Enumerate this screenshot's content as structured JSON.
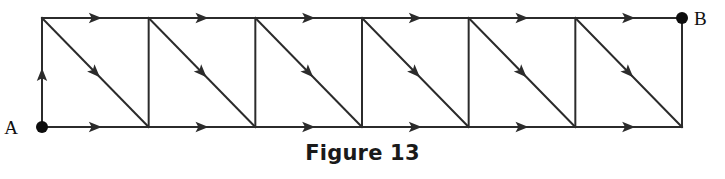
{
  "figure": {
    "caption": "Figure 13",
    "nodes": [
      {
        "id": "A",
        "label": "A",
        "x": 42,
        "y": 127,
        "label_x": 18,
        "label_y": 134
      },
      {
        "id": "B",
        "label": "B",
        "x": 682,
        "y": 18,
        "label_x": 694,
        "label_y": 25
      }
    ],
    "geometry": {
      "left": 42,
      "right": 682,
      "top": 18,
      "bottom": 127,
      "cells": 6,
      "cell_width": 106.67,
      "stroke_color": "#2b2b2b",
      "stroke_width": 2,
      "node_radius": 6,
      "node_color": "#0d0d0d"
    },
    "edges": {
      "top_arrow_count": 6,
      "bottom_arrow_count": 6,
      "diagonal_arrow_count": 6,
      "left_vertical_arrow": "up",
      "top_direction": "right",
      "bottom_direction": "right",
      "diagonal_direction": "down-right",
      "interior_vertical_count": 5,
      "interior_vertical_arrows": 0
    }
  }
}
